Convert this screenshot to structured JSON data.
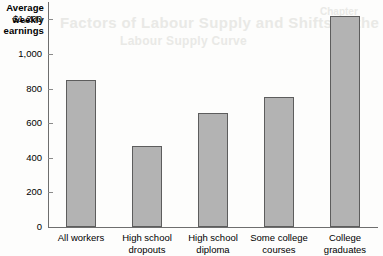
{
  "figure": {
    "axis_title_lines": [
      "Average",
      "weekly",
      "earnings"
    ],
    "bleed_through": {
      "line1": "Factors of Labour Supply and Shifts in the",
      "line2": "Labour Supply Curve",
      "line3": "Chapter"
    },
    "bar_fill_color": "#b3b3b3",
    "bar_outline_color": "#5d5d5d",
    "axis_color": "#6e6e6e"
  },
  "chart_data": {
    "type": "bar",
    "title": "",
    "xlabel": "",
    "ylabel": "Average weekly earnings",
    "categories": [
      "All workers",
      "High school dropouts",
      "High school diploma",
      "Some college courses",
      "College graduates"
    ],
    "category_lines": [
      [
        "All workers"
      ],
      [
        "High school",
        "dropouts"
      ],
      [
        "High school",
        "diploma"
      ],
      [
        "Some college",
        "courses"
      ],
      [
        "College",
        "graduates"
      ]
    ],
    "values": [
      850,
      470,
      660,
      750,
      1220
    ],
    "ylim": [
      0,
      1300
    ],
    "yticks": [
      0,
      200,
      400,
      600,
      800,
      1000,
      1200
    ],
    "ytick_labels": [
      "0",
      "200",
      "400",
      "600",
      "800",
      "1,000",
      "$1,200"
    ],
    "grid": false,
    "legend": null
  }
}
